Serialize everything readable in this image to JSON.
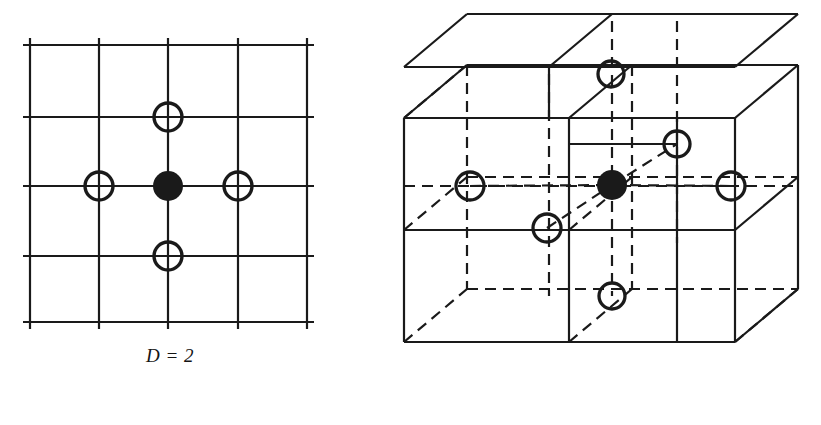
{
  "figure": {
    "background_color": "#ffffff",
    "ink_color": "#1a1a1a",
    "panels": [
      {
        "id": "d2",
        "caption": "D = 2",
        "dimension": 2,
        "description": "Two-dimensional square lattice neighborhood",
        "grid": {
          "columns": 4,
          "rows": 4,
          "x_lines": [
            30,
            99,
            168,
            238,
            307
          ],
          "y_lines": [
            45,
            117,
            186,
            256,
            322
          ],
          "tick_overhang": 7,
          "line_width": 2.2,
          "color": "#1a1a1a"
        },
        "center_node": {
          "type": "filled-dot",
          "cx": 168,
          "cy": 186,
          "r": 15,
          "fill": "#1a1a1a"
        },
        "neighbor_nodes": [
          {
            "label": "north",
            "type": "open-circle",
            "cx": 168,
            "cy": 117,
            "r": 14
          },
          {
            "label": "west",
            "type": "open-circle",
            "cx": 99,
            "cy": 186,
            "r": 14
          },
          {
            "label": "east",
            "type": "open-circle",
            "cx": 238,
            "cy": 186,
            "r": 14
          },
          {
            "label": "south",
            "type": "open-circle",
            "cx": 168,
            "cy": 256,
            "r": 14
          }
        ],
        "neighbor_count": 4
      },
      {
        "id": "d3",
        "caption": "D = 3",
        "dimension": 3,
        "description": "Three-dimensional cubic lattice neighborhood",
        "cube": {
          "subdivisions": 2,
          "front_face": {
            "left": 14,
            "top": 118,
            "right": 345,
            "bottom": 342
          },
          "depth_offset": {
            "dx": 63,
            "dy": -53
          },
          "solid_line_width": 2.2,
          "dashed_line_width": 2.2,
          "dash_pattern": "11,7",
          "color": "#1a1a1a"
        },
        "center_node": {
          "type": "filled-dot",
          "cx": 222,
          "cy": 185,
          "r": 15,
          "fill": "#1a1a1a"
        },
        "neighbor_nodes": [
          {
            "label": "up",
            "type": "open-circle",
            "cx": 221,
            "cy": 74,
            "r": 13
          },
          {
            "label": "down",
            "type": "open-circle",
            "cx": 222,
            "cy": 296,
            "r": 13
          },
          {
            "label": "west",
            "type": "open-circle",
            "cx": 80,
            "cy": 186,
            "r": 14
          },
          {
            "label": "east",
            "type": "open-circle",
            "cx": 341,
            "cy": 186,
            "r": 14
          },
          {
            "label": "back",
            "type": "open-circle",
            "cx": 287,
            "cy": 144,
            "r": 13
          },
          {
            "label": "front",
            "type": "open-circle",
            "cx": 157,
            "cy": 228,
            "r": 14
          }
        ],
        "neighbor_count": 6
      }
    ]
  }
}
